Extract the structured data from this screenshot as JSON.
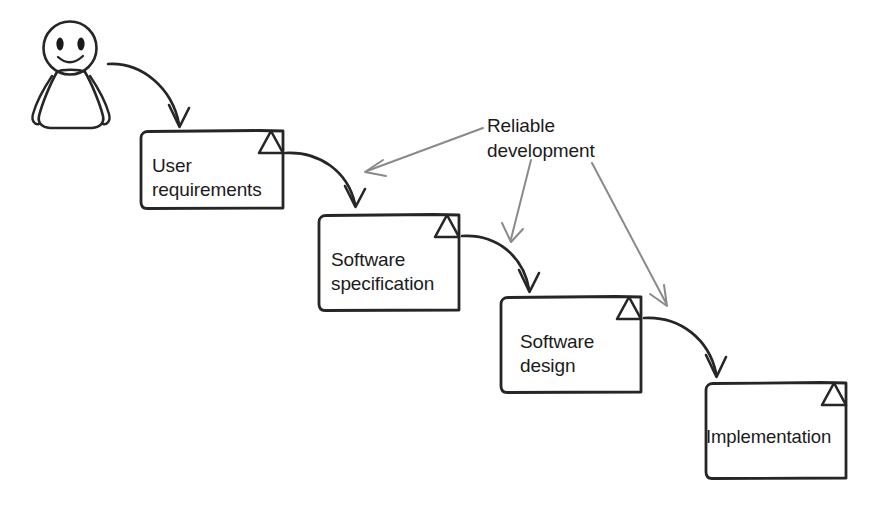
{
  "diagram": {
    "style": {
      "stroke_color": "#262626",
      "leader_color": "#8a8a8a",
      "text_color": "#1b1b1b",
      "background": "#ffffff"
    },
    "actor": {
      "name": "stick-figure-person",
      "description": "smiling person figure"
    },
    "annotation": {
      "label": "Reliable\ndevelopment",
      "line1": "Reliable",
      "line2": "development",
      "targets": [
        "user-requirements-to-software-specification",
        "software-specification-to-software-design",
        "software-design-to-implementation"
      ]
    },
    "nodes": [
      {
        "id": "user-requirements",
        "label": "User\nrequirements",
        "line1": "User",
        "line2": "requirements",
        "shape": "document",
        "x": 140,
        "y": 130,
        "width": 143,
        "height": 78
      },
      {
        "id": "software-specification",
        "label": "Software\nspecification",
        "line1": "Software",
        "line2": "specification",
        "shape": "document",
        "x": 318,
        "y": 214,
        "width": 141,
        "height": 96
      },
      {
        "id": "software-design",
        "label": "Software\ndesign",
        "line1": "Software",
        "line2": "design",
        "shape": "document",
        "x": 500,
        "y": 296,
        "width": 141,
        "height": 96
      },
      {
        "id": "implementation",
        "label": "Implementation",
        "line1": "Implementation",
        "line2": "",
        "shape": "document",
        "x": 705,
        "y": 382,
        "width": 141,
        "height": 96
      }
    ],
    "edges": [
      {
        "id": "person-to-user-requirements",
        "from": "person",
        "to": "user-requirements"
      },
      {
        "id": "user-requirements-to-software-specification",
        "from": "user-requirements",
        "to": "software-specification"
      },
      {
        "id": "software-specification-to-software-design",
        "from": "software-specification",
        "to": "software-design"
      },
      {
        "id": "software-design-to-implementation",
        "from": "software-design",
        "to": "implementation"
      }
    ]
  }
}
